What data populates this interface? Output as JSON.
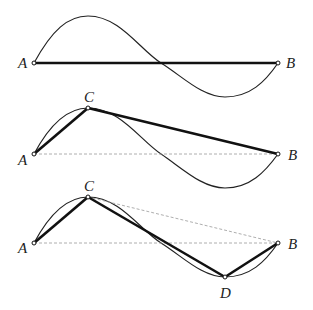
{
  "diagram": {
    "panels": [
      {
        "name": "panel-1",
        "points": {
          "A": "A",
          "B": "B"
        },
        "chord": "A-B"
      },
      {
        "name": "panel-2",
        "points": {
          "A": "A",
          "C": "C",
          "B": "B"
        },
        "chords": [
          "A-C",
          "C-B"
        ],
        "dashed": [
          "A-B"
        ]
      },
      {
        "name": "panel-3",
        "points": {
          "A": "A",
          "C": "C",
          "D": "D",
          "B": "B"
        },
        "chords": [
          "A-C",
          "C-D",
          "D-B"
        ],
        "dashed": [
          "A-B",
          "C-B"
        ]
      }
    ],
    "labels": {
      "a": "A",
      "b": "B",
      "c": "C",
      "d": "D"
    },
    "colors": {
      "curve": "#222222",
      "chord": "#111111",
      "dashed": "#999999"
    }
  }
}
